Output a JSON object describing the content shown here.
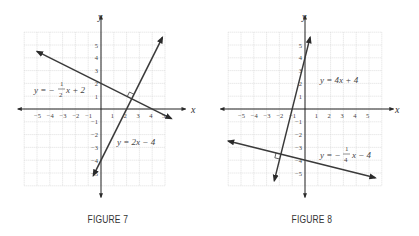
{
  "chart_data": [
    {
      "type": "line",
      "title": "FIGURE 7",
      "xlabel": "x",
      "ylabel": "y",
      "xlim": [
        -6,
        5
      ],
      "ylim": [
        -6,
        6
      ],
      "grid": true,
      "x_ticks": [
        "−5",
        "−4",
        "−3",
        "−2",
        "−1",
        "1",
        "2",
        "3",
        "4",
        "5"
      ],
      "y_ticks": [
        "5",
        "4",
        "3",
        "2",
        "1",
        "−1",
        "−2",
        "−3",
        "−4",
        "−5"
      ],
      "series": [
        {
          "name": "y = −1/2 x + 2",
          "slope": -0.5,
          "intercept": 2,
          "x_range": [
            -5,
            5.5
          ]
        },
        {
          "name": "y = 2x − 4",
          "slope": 2,
          "intercept": -4,
          "x_range": [
            -0.6,
            4.8
          ]
        }
      ],
      "annotations": [
        "right-angle marker at intersection (2.4, 0.8)"
      ]
    },
    {
      "type": "line",
      "title": "FIGURE 8",
      "xlabel": "x",
      "ylabel": "y",
      "xlim": [
        -6,
        6
      ],
      "ylim": [
        -6,
        6
      ],
      "grid": true,
      "x_ticks": [
        "−5",
        "−4",
        "−3",
        "−2",
        "−1",
        "1",
        "2",
        "3",
        "4",
        "5"
      ],
      "y_ticks": [
        "5",
        "4",
        "3",
        "2",
        "1",
        "−1",
        "−2",
        "−3",
        "−4",
        "−5"
      ],
      "series": [
        {
          "name": "y = 4x + 4",
          "slope": 4,
          "intercept": 4,
          "x_range": [
            -2.4,
            0.4
          ]
        },
        {
          "name": "y = −1/4 x − 4",
          "slope": -0.25,
          "intercept": -4,
          "x_range": [
            -6,
            5.5
          ]
        }
      ],
      "annotations": [
        "right-angle marker at intersection (−1.88, −3.53)"
      ]
    }
  ],
  "figures": [
    {
      "caption": "FIGURE 7",
      "axis_x_label": "x",
      "axis_y_label": "y",
      "eq1": {
        "lhs": "y = −",
        "num": "1",
        "den": "2",
        "rhs": "x + 2"
      },
      "eq2": "y = 2x − 4"
    },
    {
      "caption": "FIGURE 8",
      "axis_x_label": "x",
      "axis_y_label": "y",
      "eq1": "y = 4x + 4",
      "eq2": {
        "lhs": "y = −",
        "num": "1",
        "den": "4",
        "rhs": "x − 4"
      }
    }
  ],
  "colors": {
    "line": "#3a3a3a",
    "grid": "#d4d4d4",
    "axis": "#222222",
    "text": "#444444"
  }
}
